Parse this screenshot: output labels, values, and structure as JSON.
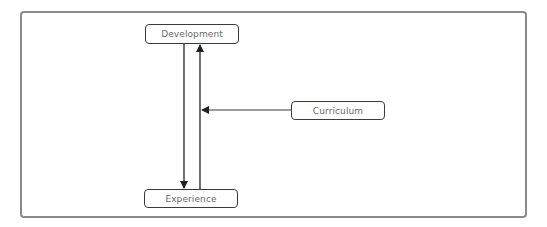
{
  "diagram": {
    "type": "flow",
    "nodes": [
      {
        "id": "development",
        "label": "Development"
      },
      {
        "id": "experience",
        "label": "Experience"
      },
      {
        "id": "curriculum",
        "label": "Curriculum"
      }
    ],
    "edges": [
      {
        "from": "development",
        "to": "experience",
        "label": ""
      },
      {
        "from": "experience",
        "to": "development",
        "label": ""
      },
      {
        "from": "curriculum",
        "to": "experience-development-edge",
        "label": ""
      }
    ]
  },
  "colors": {
    "frame_border": "#8a8a8a",
    "node_border": "#3a3a3a",
    "node_text": "#6a6a6a",
    "arrow": "#222222"
  }
}
